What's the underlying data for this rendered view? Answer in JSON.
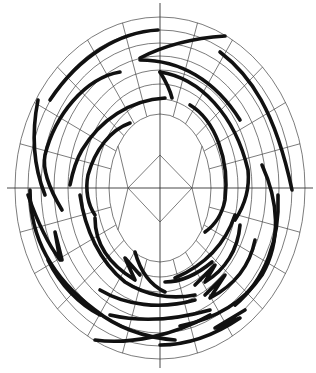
{
  "diagram": {
    "type": "polar-grid-spiral-drawing",
    "center": [
      160,
      188
    ],
    "rings": [
      {
        "rx": 51,
        "ry": 74
      },
      {
        "rx": 64,
        "ry": 89
      },
      {
        "rx": 78,
        "ry": 104
      },
      {
        "rx": 92,
        "ry": 118
      },
      {
        "rx": 106,
        "ry": 132
      },
      {
        "rx": 119,
        "ry": 145
      },
      {
        "rx": 132,
        "ry": 158
      },
      {
        "rx": 145,
        "ry": 171
      }
    ],
    "spoke_step_deg": 15,
    "axes": {
      "h": [
        7,
        313
      ],
      "v": [
        3,
        368
      ]
    },
    "diamond": {
      "left": 128,
      "right": 192,
      "top": 155,
      "bottom": 222
    },
    "colors": {
      "grid": "#444444",
      "stroke": "#111111",
      "background": "#ffffff"
    }
  }
}
